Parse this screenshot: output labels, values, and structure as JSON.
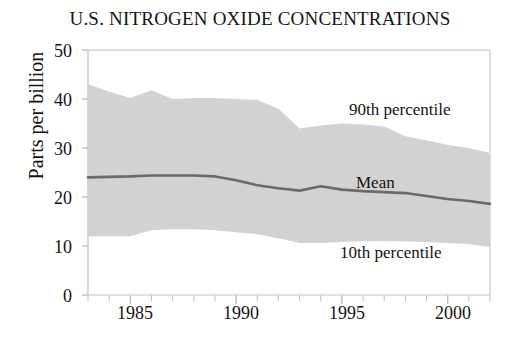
{
  "chart_data": {
    "type": "area",
    "title": "U.S. NITROGEN OXIDE CONCENTRATIONS",
    "xlabel": "",
    "ylabel": "Parts per billion",
    "ylim": [
      0,
      50
    ],
    "xlim": [
      1983,
      2002
    ],
    "yticks": [
      0,
      10,
      20,
      30,
      40,
      50
    ],
    "ytick_labels": [
      "0",
      "10",
      "20",
      "30",
      "40",
      "50"
    ],
    "xticks": [
      1985,
      1990,
      1995,
      2000
    ],
    "xtick_labels": [
      "1985",
      "1990",
      "1995",
      "2000"
    ],
    "minor_xticks_every": 1,
    "grid": false,
    "legend_position": "inline-annotations",
    "x": [
      1983,
      1984,
      1985,
      1986,
      1987,
      1988,
      1989,
      1990,
      1991,
      1992,
      1993,
      1994,
      1995,
      1996,
      1997,
      1998,
      1999,
      2000,
      2001,
      2002
    ],
    "series": [
      {
        "name": "90th percentile",
        "color": "#d2d2d2",
        "values": [
          43.0,
          41.5,
          40.2,
          41.8,
          40.0,
          40.2,
          40.2,
          40.0,
          39.8,
          38.0,
          34.0,
          34.6,
          35.0,
          34.8,
          34.4,
          32.4,
          31.6,
          30.6,
          30.0,
          29.0
        ]
      },
      {
        "name": "Mean",
        "color": "#6a6a6a",
        "values": [
          24.0,
          24.1,
          24.2,
          24.4,
          24.4,
          24.4,
          24.2,
          23.4,
          22.4,
          21.8,
          21.3,
          22.2,
          21.5,
          21.2,
          21.0,
          20.8,
          20.2,
          19.6,
          19.2,
          18.6
        ]
      },
      {
        "name": "10th percentile",
        "color": "#d2d2d2",
        "values": [
          12.0,
          12.0,
          12.0,
          13.2,
          13.4,
          13.4,
          13.2,
          12.8,
          12.4,
          11.6,
          10.6,
          10.6,
          10.8,
          11.0,
          11.0,
          10.9,
          10.8,
          10.6,
          10.4,
          9.8
        ]
      }
    ],
    "band": {
      "lower_series": "10th percentile",
      "upper_series": "90th percentile",
      "fill_color": "#d2d2d2"
    },
    "annotations": [
      {
        "text": "90th percentile",
        "x": 1995.4,
        "y": 37.5
      },
      {
        "text": "Mean",
        "x": 1995.6,
        "y": 25.2
      },
      {
        "text": "10th percentile",
        "x": 1994.9,
        "y": 7.2
      }
    ]
  },
  "axes": {
    "axis_color": "#bfbfbf",
    "text_color": "#141414"
  }
}
